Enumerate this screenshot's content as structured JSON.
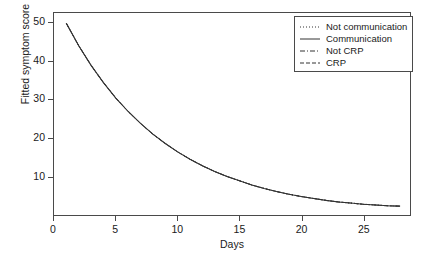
{
  "chart_data": {
    "type": "line",
    "title": "",
    "xlabel": "Days",
    "ylabel": "Fitted symptom score",
    "xlim": [
      0,
      28.8
    ],
    "ylim": [
      0,
      52.5
    ],
    "xticks": [
      0,
      5,
      10,
      15,
      20,
      25
    ],
    "yticks": [
      10,
      20,
      30,
      40,
      50
    ],
    "grid": false,
    "legend_position": "top-right",
    "x": [
      1,
      2,
      3,
      4,
      5,
      6,
      7,
      8,
      9,
      10,
      11,
      12,
      13,
      14,
      15,
      16,
      17,
      18,
      19,
      20,
      21,
      22,
      23,
      24,
      25,
      26,
      27,
      28
    ],
    "series": [
      {
        "name": "Not communication",
        "style": "dotted",
        "values": [
          49.8,
          44.0,
          38.9,
          34.4,
          30.4,
          26.9,
          23.8,
          21.0,
          18.6,
          16.4,
          14.5,
          12.8,
          11.3,
          10.0,
          8.9,
          7.8,
          6.9,
          6.1,
          5.4,
          4.8,
          4.3,
          3.8,
          3.4,
          3.1,
          2.8,
          2.6,
          2.4,
          2.3
        ]
      },
      {
        "name": "Communication",
        "style": "solid",
        "values": [
          49.8,
          44.0,
          38.9,
          34.4,
          30.4,
          26.9,
          23.8,
          21.0,
          18.6,
          16.4,
          14.5,
          12.8,
          11.3,
          10.0,
          8.9,
          7.8,
          6.9,
          6.1,
          5.4,
          4.8,
          4.3,
          3.8,
          3.4,
          3.1,
          2.8,
          2.6,
          2.4,
          2.3
        ]
      },
      {
        "name": "Not CRP",
        "style": "dash-dot",
        "values": [
          49.8,
          44.0,
          38.9,
          34.4,
          30.4,
          26.9,
          23.8,
          21.0,
          18.6,
          16.4,
          14.5,
          12.8,
          11.3,
          10.0,
          8.9,
          7.8,
          6.9,
          6.1,
          5.4,
          4.8,
          4.3,
          3.8,
          3.4,
          3.1,
          2.8,
          2.6,
          2.4,
          2.3
        ]
      },
      {
        "name": "CRP",
        "style": "dashed",
        "values": [
          49.8,
          44.0,
          38.9,
          34.4,
          30.4,
          26.9,
          23.8,
          21.0,
          18.6,
          16.4,
          14.5,
          12.8,
          11.3,
          10.0,
          8.9,
          7.8,
          6.9,
          6.1,
          5.4,
          4.8,
          4.3,
          3.8,
          3.4,
          3.1,
          2.8,
          2.6,
          2.4,
          2.3
        ]
      }
    ]
  },
  "axes": {
    "ylabel": "Fitted symptom score",
    "xlabel": "Days",
    "yticks": [
      "10",
      "20",
      "30",
      "40",
      "50"
    ],
    "xticks": [
      "0",
      "5",
      "10",
      "15",
      "20",
      "25"
    ]
  },
  "legend": {
    "entries": [
      {
        "label": "Not communication",
        "style": "dotted"
      },
      {
        "label": "Communication",
        "style": "solid"
      },
      {
        "label": "Not CRP",
        "style": "dash-dot"
      },
      {
        "label": "CRP",
        "style": "dashed"
      }
    ]
  },
  "colors": {
    "line": "#333333",
    "axis": "#4a4a4a",
    "text": "#1a1a1a",
    "background": "#ffffff"
  }
}
